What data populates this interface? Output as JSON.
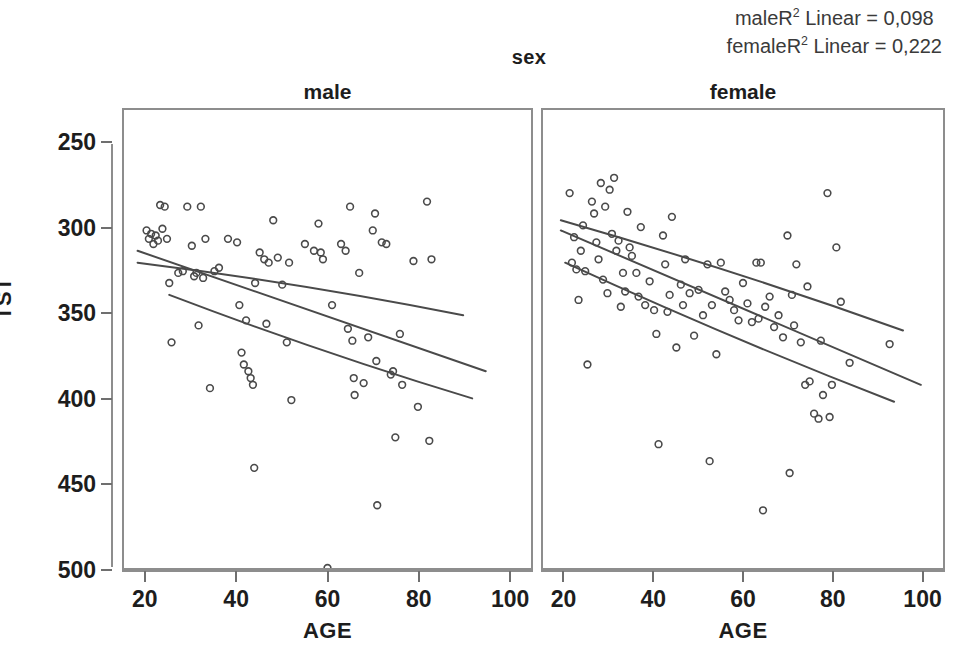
{
  "figure": {
    "group_title": "sex",
    "y_axis_title": "TST",
    "x_axis_title_male": "AGE",
    "x_axis_title_female": "AGE",
    "annotations": {
      "male_r2_prefix": "maleR",
      "male_r2_sup": "2",
      "male_r2_text": " Linear = 0,098",
      "female_r2_prefix": "femaleR",
      "female_r2_sup": "2",
      "female_r2_text": " Linear = 0,222"
    },
    "panels": [
      {
        "key": "male",
        "label": "male"
      },
      {
        "key": "female",
        "label": "female"
      }
    ],
    "y_ticks": [
      "500",
      "450",
      "400",
      "350",
      "300",
      "250"
    ],
    "x_ticks": [
      "20",
      "40",
      "60",
      "80",
      "100"
    ],
    "marker_color": "#4a4a4a",
    "line_color": "#4a4a4a",
    "axis_color": "#8d8d8d",
    "background": "#ffffff"
  },
  "chart_data": {
    "type": "scatter",
    "title": "sex",
    "xlabel": "AGE",
    "ylabel": "TST",
    "xlim": [
      15,
      105
    ],
    "ylim": [
      250,
      520
    ],
    "xticks": [
      20,
      40,
      60,
      80,
      100
    ],
    "yticks": [
      250,
      300,
      350,
      400,
      450,
      500
    ],
    "grid": false,
    "legend": "none",
    "facet_variable": "sex",
    "facets": [
      "male",
      "female"
    ],
    "annotations": [
      "maleR2 Linear = 0,098",
      "femaleR2 Linear = 0,222"
    ],
    "series": [
      {
        "name": "male",
        "facet": "male",
        "r_squared": 0.098,
        "points": [
          [
            20,
            449
          ],
          [
            20.5,
            444
          ],
          [
            21,
            447
          ],
          [
            21.5,
            441
          ],
          [
            22,
            446
          ],
          [
            22.5,
            443
          ],
          [
            23,
            464
          ],
          [
            23.5,
            450
          ],
          [
            24,
            463
          ],
          [
            24.5,
            444
          ],
          [
            25,
            418
          ],
          [
            25.5,
            383
          ],
          [
            27,
            424
          ],
          [
            28,
            425
          ],
          [
            29,
            463
          ],
          [
            30,
            440
          ],
          [
            30.5,
            422
          ],
          [
            31,
            424
          ],
          [
            31.5,
            393
          ],
          [
            32,
            463
          ],
          [
            32.5,
            421
          ],
          [
            33,
            444
          ],
          [
            34,
            356
          ],
          [
            35,
            425
          ],
          [
            36,
            427
          ],
          [
            38,
            444
          ],
          [
            40,
            442
          ],
          [
            40.5,
            405
          ],
          [
            41,
            377
          ],
          [
            41.5,
            370
          ],
          [
            42,
            396
          ],
          [
            42.5,
            366
          ],
          [
            43,
            362
          ],
          [
            43.5,
            358
          ],
          [
            43.8,
            309
          ],
          [
            44,
            418
          ],
          [
            45,
            436
          ],
          [
            46,
            432
          ],
          [
            46.5,
            394
          ],
          [
            47,
            430
          ],
          [
            48,
            455
          ],
          [
            49,
            433
          ],
          [
            50,
            417
          ],
          [
            51,
            383
          ],
          [
            51.5,
            430
          ],
          [
            52,
            349
          ],
          [
            55,
            441
          ],
          [
            57,
            437
          ],
          [
            58,
            453
          ],
          [
            58.5,
            436
          ],
          [
            59,
            432
          ],
          [
            60,
            250
          ],
          [
            61,
            405
          ],
          [
            63,
            441
          ],
          [
            64,
            437
          ],
          [
            64.5,
            391
          ],
          [
            65,
            463
          ],
          [
            65.5,
            384
          ],
          [
            65.8,
            362
          ],
          [
            66,
            352
          ],
          [
            67,
            424
          ],
          [
            68,
            359
          ],
          [
            69,
            386
          ],
          [
            70,
            449
          ],
          [
            70.5,
            459
          ],
          [
            70.8,
            372
          ],
          [
            71,
            287
          ],
          [
            72,
            442
          ],
          [
            73,
            441
          ],
          [
            74,
            364
          ],
          [
            74.5,
            366
          ],
          [
            75,
            327
          ],
          [
            76,
            388
          ],
          [
            76.5,
            358
          ],
          [
            79,
            431
          ],
          [
            80,
            345
          ],
          [
            82,
            466
          ],
          [
            82.5,
            325
          ],
          [
            83,
            432
          ]
        ],
        "fit_line": {
          "x": [
            18,
            95
          ],
          "y": [
            437,
            366
          ]
        },
        "confidence_upper": {
          "x": [
            18,
            90
          ],
          "y": [
            430,
            399
          ]
        },
        "confidence_lower": {
          "x": [
            25,
            92
          ],
          "y": [
            411,
            350
          ]
        }
      },
      {
        "name": "female",
        "facet": "female",
        "r_squared": 0.222,
        "points": [
          [
            21,
            471
          ],
          [
            21.5,
            430
          ],
          [
            22,
            445
          ],
          [
            22.5,
            426
          ],
          [
            23,
            408
          ],
          [
            23.5,
            437
          ],
          [
            24,
            452
          ],
          [
            24.5,
            425
          ],
          [
            25,
            370
          ],
          [
            26,
            466
          ],
          [
            26.5,
            459
          ],
          [
            27,
            442
          ],
          [
            27.5,
            432
          ],
          [
            28,
            477
          ],
          [
            28.5,
            420
          ],
          [
            29,
            463
          ],
          [
            29.5,
            412
          ],
          [
            30,
            473
          ],
          [
            30.5,
            447
          ],
          [
            31,
            480
          ],
          [
            31.5,
            437
          ],
          [
            32,
            443
          ],
          [
            32.5,
            404
          ],
          [
            33,
            424
          ],
          [
            33.5,
            413
          ],
          [
            34,
            460
          ],
          [
            34.5,
            439
          ],
          [
            35,
            434
          ],
          [
            36,
            424
          ],
          [
            36.5,
            410
          ],
          [
            37,
            451
          ],
          [
            38,
            405
          ],
          [
            39,
            419
          ],
          [
            40,
            402
          ],
          [
            40.5,
            388
          ],
          [
            41,
            323
          ],
          [
            42,
            446
          ],
          [
            42.5,
            429
          ],
          [
            43,
            401
          ],
          [
            43.5,
            411
          ],
          [
            44,
            457
          ],
          [
            45,
            380
          ],
          [
            46,
            417
          ],
          [
            46.5,
            405
          ],
          [
            47,
            432
          ],
          [
            48,
            412
          ],
          [
            49,
            387
          ],
          [
            50,
            414
          ],
          [
            51,
            399
          ],
          [
            52,
            429
          ],
          [
            52.5,
            313
          ],
          [
            53,
            405
          ],
          [
            54,
            376
          ],
          [
            55,
            430
          ],
          [
            56,
            413
          ],
          [
            57,
            408
          ],
          [
            58,
            402
          ],
          [
            59,
            396
          ],
          [
            60,
            418
          ],
          [
            61,
            406
          ],
          [
            62,
            395
          ],
          [
            63,
            430
          ],
          [
            63.5,
            397
          ],
          [
            64,
            430
          ],
          [
            64.5,
            284
          ],
          [
            65,
            404
          ],
          [
            66,
            410
          ],
          [
            67,
            392
          ],
          [
            68,
            399
          ],
          [
            69,
            386
          ],
          [
            70,
            446
          ],
          [
            70.5,
            306
          ],
          [
            71,
            411
          ],
          [
            71.5,
            393
          ],
          [
            72,
            429
          ],
          [
            73,
            383
          ],
          [
            74,
            358
          ],
          [
            74.5,
            416
          ],
          [
            75,
            360
          ],
          [
            76,
            341
          ],
          [
            77,
            338
          ],
          [
            77.5,
            384
          ],
          [
            78,
            352
          ],
          [
            79,
            471
          ],
          [
            79.5,
            339
          ],
          [
            80,
            358
          ],
          [
            81,
            439
          ],
          [
            82,
            407
          ],
          [
            84,
            371
          ],
          [
            93,
            382
          ]
        ],
        "fit_line": {
          "x": [
            19,
            100
          ],
          "y": [
            449,
            358
          ]
        },
        "confidence_upper": {
          "x": [
            19,
            96
          ],
          "y": [
            455,
            390
          ]
        },
        "confidence_lower": {
          "x": [
            20,
            94
          ],
          "y": [
            430,
            348
          ]
        }
      }
    ]
  }
}
